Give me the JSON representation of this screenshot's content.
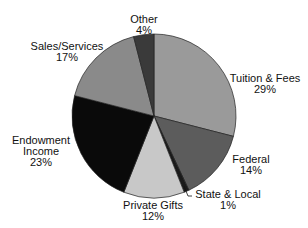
{
  "chart_data": {
    "type": "pie",
    "title": "",
    "categories": [
      "Tuition & Fees",
      "Federal",
      "State & Local",
      "Private Gifts",
      "Endowment Income",
      "Sales/Services",
      "Other"
    ],
    "values": [
      29,
      14,
      1,
      12,
      23,
      17,
      4
    ],
    "unit": "%",
    "colors": [
      "#9a9a9a",
      "#5c5c5c",
      "#1a1a1a",
      "#c8c8c8",
      "#0a0a0a",
      "#8a8a8a",
      "#3a3a3a"
    ],
    "start_angle_deg": 0,
    "direction": "clockwise",
    "legend": "none (direct labels)"
  },
  "labels": [
    {
      "line1": "Tuition & Fees",
      "line2": "29%"
    },
    {
      "line1": "Federal",
      "line2": "14%"
    },
    {
      "line1": "State & Local",
      "line2": "1%"
    },
    {
      "line1": "Private Gifts",
      "line2": "12%"
    },
    {
      "line1": "Endowment",
      "line2": "Income",
      "line3": "23%"
    },
    {
      "line1": "Sales/Services",
      "line2": "17%"
    },
    {
      "line1": "Other",
      "line2": "4%"
    }
  ]
}
